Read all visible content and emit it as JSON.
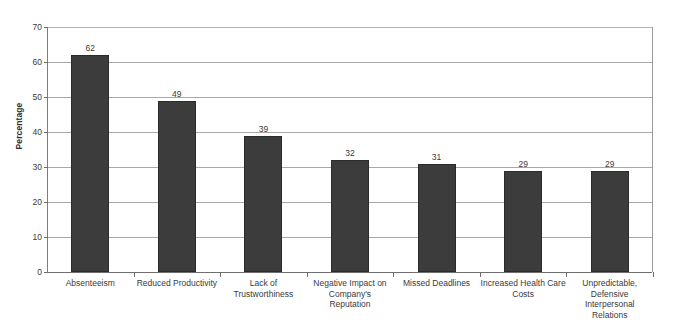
{
  "chart_data": {
    "type": "bar",
    "title": "",
    "subtitle": "",
    "xlabel": "",
    "ylabel": "Percentage",
    "ylim": [
      0,
      70
    ],
    "yticks": [
      0,
      10,
      20,
      30,
      40,
      50,
      60,
      70
    ],
    "grid": "horizontal",
    "legend": "none",
    "orientation": "vertical",
    "bar_color": "#3c3c3c",
    "data_labels": true,
    "categories": [
      "Absenteeism",
      "Reduced Productivity",
      "Lack of Trustworthiness",
      "Negative Impact on Company's Reputation",
      "Missed Deadlines",
      "Increased Health Care Costs",
      "Unpredictable, Defensive Interpersonal Relations"
    ],
    "category_lines": [
      [
        "Absenteeism"
      ],
      [
        "Reduced Productivity"
      ],
      [
        "Lack of",
        "Trustworthiness"
      ],
      [
        "Negative Impact on",
        "Company's",
        "Reputation"
      ],
      [
        "Missed Deadlines"
      ],
      [
        "Increased Health Care",
        "Costs"
      ],
      [
        "Unpredictable,",
        "Defensive",
        "Interpersonal",
        "Relations"
      ]
    ],
    "values": [
      62,
      49,
      39,
      32,
      31,
      29,
      29
    ]
  }
}
